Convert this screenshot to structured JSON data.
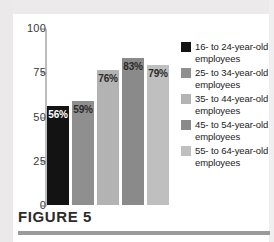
{
  "figure": {
    "caption": "FIGURE 5"
  },
  "chart_data": {
    "type": "bar",
    "title": "",
    "xlabel": "",
    "ylabel": "",
    "ylim": [
      0,
      100
    ],
    "yticks": [
      "0",
      "25",
      "50",
      "75",
      "100"
    ],
    "grid": false,
    "legend_position": "right",
    "categories": [
      "16- to 24-year-old employees",
      "25- to 34-year-old employees",
      "35- to 44-year-old employees",
      "45- to 54-year-old employees",
      "55- to 64-year-old employees"
    ],
    "values": [
      56,
      59,
      76,
      83,
      79
    ],
    "data_labels": [
      "56%",
      "59%",
      "76%",
      "83%",
      "79%"
    ],
    "colors": [
      "#131313",
      "#8f8f8f",
      "#b3b3b3",
      "#8a8a8a",
      "#bfbfbf"
    ],
    "label_colors": [
      "#ffffff",
      "#2a2a2a",
      "#2a2a2a",
      "#2a2a2a",
      "#2a2a2a"
    ]
  },
  "legend": {
    "items": [
      {
        "label": "16- to 24-year-old employees",
        "color": "#131313"
      },
      {
        "label": "25- to 34-year-old employees",
        "color": "#8f8f8f"
      },
      {
        "label": "35- to 44-year-old employees",
        "color": "#b3b3b3"
      },
      {
        "label": "45- to 54-year-old employees",
        "color": "#8a8a8a"
      },
      {
        "label": "55- to 64-year-old employees",
        "color": "#bfbfbf"
      }
    ]
  }
}
